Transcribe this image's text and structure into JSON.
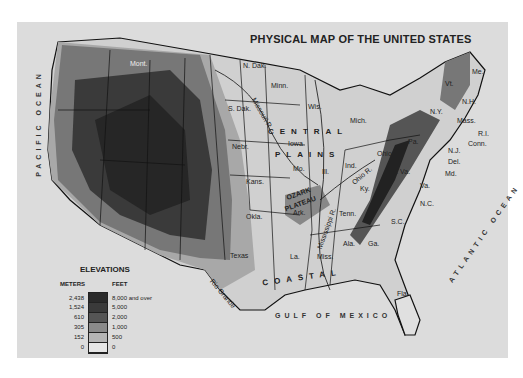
{
  "title": "PHYSICAL MAP OF THE UNITED STATES",
  "oceans": {
    "pacific": "PACIFIC OCEAN",
    "atlantic": "ATLANTIC OCEAN",
    "gulf": "GULF OF MEXICO"
  },
  "regions": {
    "central_plains_1": "CENTRAL",
    "central_plains_2": "PLAINS",
    "ozark_1": "OZARK",
    "ozark_2": "PLATEAU",
    "coastal": "COASTAL",
    "appalachian": "APPALACHIAN MOUNTAINS",
    "piedmont": "PIEDMONT",
    "great_plains": "GREAT PLAINS"
  },
  "states": {
    "mont": "Mont.",
    "ndak": "N. Dak.",
    "sdak": "S. Dak.",
    "nebr": "Nebr.",
    "kans": "Kans.",
    "okla": "Okla.",
    "texas": "Texas",
    "minn": "Minn.",
    "wis": "Wis.",
    "mich": "Mich.",
    "iowa": "Iowa",
    "mo": "Mo.",
    "ill": "Ill.",
    "ind": "Ind.",
    "ohio": "Ohio",
    "ky": "Ky.",
    "tenn": "Tenn.",
    "ark": "Ark.",
    "la": "La.",
    "miss": "Miss.",
    "ala": "Ala.",
    "ga": "Ga.",
    "fla": "Fla.",
    "sc": "S.C.",
    "nc": "N.C.",
    "va": "Va.",
    "wva": "W. Va.",
    "md": "Md.",
    "del": "Del.",
    "nj": "N.J.",
    "pa": "Pa.",
    "ny": "N.Y.",
    "vt": "Vt.",
    "nh": "N.H.",
    "me": "Me.",
    "mass": "Mass.",
    "ri": "R.I.",
    "conn": "Conn."
  },
  "rivers": {
    "missouri": "Missouri R.",
    "mississippi": "Mississippi R.",
    "ohio": "Ohio R.",
    "rio_grande": "Rio Grande"
  },
  "legend": {
    "title": "ELEVATIONS",
    "meters_header": "METERS",
    "feet_header": "FEET",
    "meters": [
      "2,438",
      "1,524",
      "610",
      "305",
      "152",
      "0"
    ],
    "feet": [
      "8,000 and over",
      "5,000",
      "2,000",
      "1,000",
      "500",
      "0"
    ],
    "colors": [
      "#2a2a2a",
      "#4a4a4a",
      "#6e6e6e",
      "#9a9a9a",
      "#bdbdbd",
      "#e6e6e6"
    ]
  }
}
